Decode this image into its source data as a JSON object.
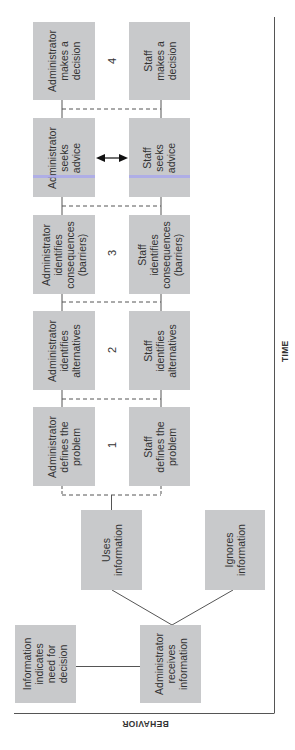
{
  "diagram": {
    "axes": {
      "x_label": "TIME",
      "y_label": "BEHAVIOR"
    },
    "start_nodes": {
      "info_need": "Information\nindicates\nneed for\ndecision",
      "admin_receives": "Administrator\nreceives\ninformation",
      "uses_info": "Uses\ninformation",
      "ignores_info": "Ignores\ninformation"
    },
    "stages": [
      {
        "number": "1",
        "admin": "Administrator\ndefines the\nproblem",
        "staff": "Staff\ndefines the\nproblem"
      },
      {
        "number": "2",
        "admin": "Administrator\nidentifies\nalternatives",
        "staff": "Staff\nidentifies\nalternatives"
      },
      {
        "number": "3",
        "admin": "Administrator\nidentifies\nconsequences\n(barriers)",
        "staff": "Staff\nidentifies\nconsequences\n(barriers)"
      },
      {
        "number": "",
        "admin": "Administrator\nseeks\nadvice",
        "staff": "Staff\nseeks\nadvice"
      },
      {
        "number": "4",
        "admin": "Administrator\nmakes a\ndecision",
        "staff": "Staff\nmakes a\ndecision"
      }
    ],
    "colors": {
      "box_fill": "#c8c9cb",
      "line": "#555555",
      "text": "#333333"
    }
  }
}
